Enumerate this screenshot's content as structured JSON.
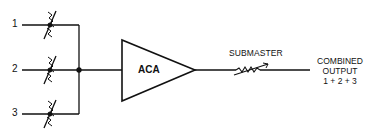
{
  "diagram": {
    "type": "audio mixing signal flow",
    "inputs": [
      {
        "label": "1",
        "y": 25
      },
      {
        "label": "2",
        "y": 70
      },
      {
        "label": "3",
        "y": 114
      }
    ],
    "amplifier": {
      "label": "ACA"
    },
    "submaster": {
      "label": "SUBMASTER"
    },
    "output": {
      "line1": "COMBINED",
      "line2": "OUTPUT",
      "line3": "1 + 2 + 3"
    },
    "colors": {
      "stroke": "#111111",
      "background": "#ffffff"
    }
  }
}
